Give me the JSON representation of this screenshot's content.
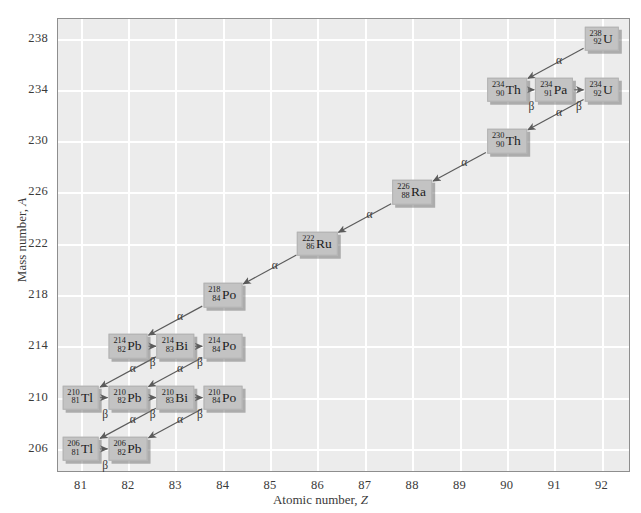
{
  "figure": {
    "type": "decay-chain-diagram",
    "plot_bg": "#ececec",
    "grid_color": "#ffffff",
    "node_fill": "#c3c3c3"
  },
  "axes": {
    "x": {
      "label_pre": "Atomic number, ",
      "label_italic": "Z",
      "ticks": [
        "81",
        "82",
        "83",
        "84",
        "85",
        "86",
        "87",
        "88",
        "89",
        "90",
        "91",
        "92"
      ],
      "min": 80.5,
      "max": 92.6
    },
    "y": {
      "label_pre": "Mass number, ",
      "label_italic": "A",
      "ticks": [
        "238",
        "234",
        "230",
        "226",
        "222",
        "218",
        "214",
        "210",
        "206"
      ],
      "min": 204.2,
      "max": 239.6
    }
  },
  "chart_data": {
    "type": "scatter",
    "title": "",
    "xlabel": "Atomic number, Z",
    "ylabel": "Mass number, A",
    "xlim": [
      80.5,
      92.6
    ],
    "ylim": [
      204.2,
      239.6
    ],
    "grid": true,
    "legend": "none",
    "nodes": [
      {
        "id": "U238",
        "mass": "238",
        "z": "92",
        "symbol": "U",
        "x": 92,
        "y": 238
      },
      {
        "id": "Th234",
        "mass": "234",
        "z": "90",
        "symbol": "Th",
        "x": 90,
        "y": 234
      },
      {
        "id": "Pa234",
        "mass": "234",
        "z": "91",
        "symbol": "Pa",
        "x": 91,
        "y": 234
      },
      {
        "id": "U234",
        "mass": "234",
        "z": "92",
        "symbol": "U",
        "x": 92,
        "y": 234
      },
      {
        "id": "Th230",
        "mass": "230",
        "z": "90",
        "symbol": "Th",
        "x": 90,
        "y": 230
      },
      {
        "id": "Ra226",
        "mass": "226",
        "z": "88",
        "symbol": "Ra",
        "x": 88,
        "y": 226
      },
      {
        "id": "Rn222",
        "mass": "222",
        "z": "86",
        "symbol": "Ru",
        "x": 86,
        "y": 222
      },
      {
        "id": "Po218",
        "mass": "218",
        "z": "84",
        "symbol": "Po",
        "x": 84,
        "y": 218
      },
      {
        "id": "Pb214",
        "mass": "214",
        "z": "82",
        "symbol": "Pb",
        "x": 82,
        "y": 214
      },
      {
        "id": "Bi214",
        "mass": "214",
        "z": "83",
        "symbol": "Bi",
        "x": 83,
        "y": 214
      },
      {
        "id": "Po214",
        "mass": "214",
        "z": "84",
        "symbol": "Po",
        "x": 84,
        "y": 214
      },
      {
        "id": "Tl210",
        "mass": "210",
        "z": "81",
        "symbol": "Tl",
        "x": 81,
        "y": 210
      },
      {
        "id": "Pb210",
        "mass": "210",
        "z": "82",
        "symbol": "Pb",
        "x": 82,
        "y": 210
      },
      {
        "id": "Bi210",
        "mass": "210",
        "z": "83",
        "symbol": "Bi",
        "x": 83,
        "y": 210
      },
      {
        "id": "Po210",
        "mass": "210",
        "z": "84",
        "symbol": "Po",
        "x": 84,
        "y": 210
      },
      {
        "id": "Tl206",
        "mass": "206",
        "z": "81",
        "symbol": "Tl",
        "x": 81,
        "y": 206
      },
      {
        "id": "Pb206",
        "mass": "206",
        "z": "82",
        "symbol": "Pb",
        "x": 82,
        "y": 206
      }
    ],
    "decays": [
      {
        "from": "U238",
        "to": "Th234",
        "kind": "alpha",
        "label": "α",
        "label_x": 91.1,
        "label_y": 236.35
      },
      {
        "from": "Th234",
        "to": "Pa234",
        "kind": "beta",
        "label": "β",
        "label_x": 90.52,
        "label_y": 232.75
      },
      {
        "from": "Pa234",
        "to": "U234",
        "kind": "beta",
        "label": "β",
        "label_x": 91.52,
        "label_y": 232.75
      },
      {
        "from": "U234",
        "to": "Th230",
        "kind": "alpha",
        "label": "α",
        "label_x": 91.1,
        "label_y": 232.3
      },
      {
        "from": "Th230",
        "to": "Ra226",
        "kind": "alpha",
        "label": "α",
        "label_x": 89.1,
        "label_y": 228.35
      },
      {
        "from": "Ra226",
        "to": "Rn222",
        "kind": "alpha",
        "label": "α",
        "label_x": 87.1,
        "label_y": 224.35
      },
      {
        "from": "Rn222",
        "to": "Po218",
        "kind": "alpha",
        "label": "α",
        "label_x": 85.1,
        "label_y": 220.35
      },
      {
        "from": "Po218",
        "to": "Pb214",
        "kind": "alpha",
        "label": "α",
        "label_x": 83.1,
        "label_y": 216.35
      },
      {
        "from": "Pb214",
        "to": "Bi214",
        "kind": "beta",
        "label": "β",
        "label_x": 82.52,
        "label_y": 212.75
      },
      {
        "from": "Bi214",
        "to": "Po214",
        "kind": "beta",
        "label": "β",
        "label_x": 83.52,
        "label_y": 212.75
      },
      {
        "from": "Bi214",
        "to": "Tl210",
        "kind": "alpha",
        "label": "α",
        "label_x": 82.1,
        "label_y": 212.3
      },
      {
        "from": "Po214",
        "to": "Pb210",
        "kind": "alpha",
        "label": "α",
        "label_x": 83.1,
        "label_y": 212.3
      },
      {
        "from": "Tl210",
        "to": "Pb210",
        "kind": "beta",
        "label": "β",
        "label_x": 81.52,
        "label_y": 208.75
      },
      {
        "from": "Pb210",
        "to": "Bi210",
        "kind": "beta",
        "label": "β",
        "label_x": 82.52,
        "label_y": 208.75
      },
      {
        "from": "Bi210",
        "to": "Po210",
        "kind": "beta",
        "label": "β",
        "label_x": 83.52,
        "label_y": 208.75
      },
      {
        "from": "Bi210",
        "to": "Tl206",
        "kind": "alpha",
        "label": "α",
        "label_x": 82.1,
        "label_y": 208.3
      },
      {
        "from": "Po210",
        "to": "Pb206",
        "kind": "alpha",
        "label": "α",
        "label_x": 83.1,
        "label_y": 208.3
      },
      {
        "from": "Tl206",
        "to": "Pb206",
        "kind": "beta",
        "label": "β",
        "label_x": 81.52,
        "label_y": 204.75
      }
    ]
  }
}
